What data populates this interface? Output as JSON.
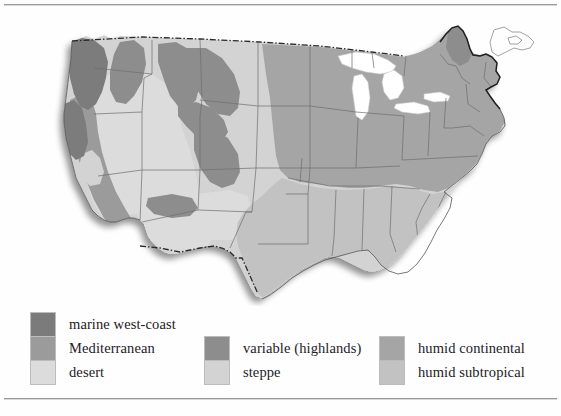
{
  "figure": {
    "kind": "thematic-map"
  },
  "colors": {
    "marine_west_coast": "#7b7b7b",
    "mediterranean": "#9b9b9b",
    "desert": "#dcdcdc",
    "variable_highlands": "#8d8d8d",
    "steppe": "#d3d3d3",
    "humid_continental": "#a5a5a5",
    "humid_subtropical": "#c2c2c2",
    "water": "#ffffff",
    "state_border": "#6f6f6f",
    "country_border": "#2a2a2a",
    "rule": "#9a9a9a"
  },
  "legend": {
    "groups": [
      {
        "id": "group-left",
        "entries": [
          {
            "label": "marine west-coast",
            "color": "#7b7b7b"
          },
          {
            "label": "Mediterranean",
            "color": "#9b9b9b"
          },
          {
            "label": "desert",
            "color": "#dcdcdc"
          }
        ]
      },
      {
        "id": "group-middle",
        "entries": [
          {
            "label": "variable (highlands)",
            "color": "#8d8d8d"
          },
          {
            "label": "steppe",
            "color": "#d3d3d3"
          }
        ]
      },
      {
        "id": "group-right",
        "entries": [
          {
            "label": "humid continental",
            "color": "#a5a5a5"
          },
          {
            "label": "humid subtropical",
            "color": "#c2c2c2"
          }
        ]
      }
    ]
  },
  "map_regions": [
    {
      "name": "Pacific Northwest coast",
      "climate": "marine west-coast"
    },
    {
      "name": "California coast",
      "climate": "Mediterranean"
    },
    {
      "name": "Southwest basins",
      "climate": "desert"
    },
    {
      "name": "Rocky Mountains",
      "climate": "variable (highlands)"
    },
    {
      "name": "Great Plains",
      "climate": "steppe"
    },
    {
      "name": "Midwest and Northeast",
      "climate": "humid continental"
    },
    {
      "name": "Southeast and Gulf",
      "climate": "humid subtropical"
    }
  ]
}
